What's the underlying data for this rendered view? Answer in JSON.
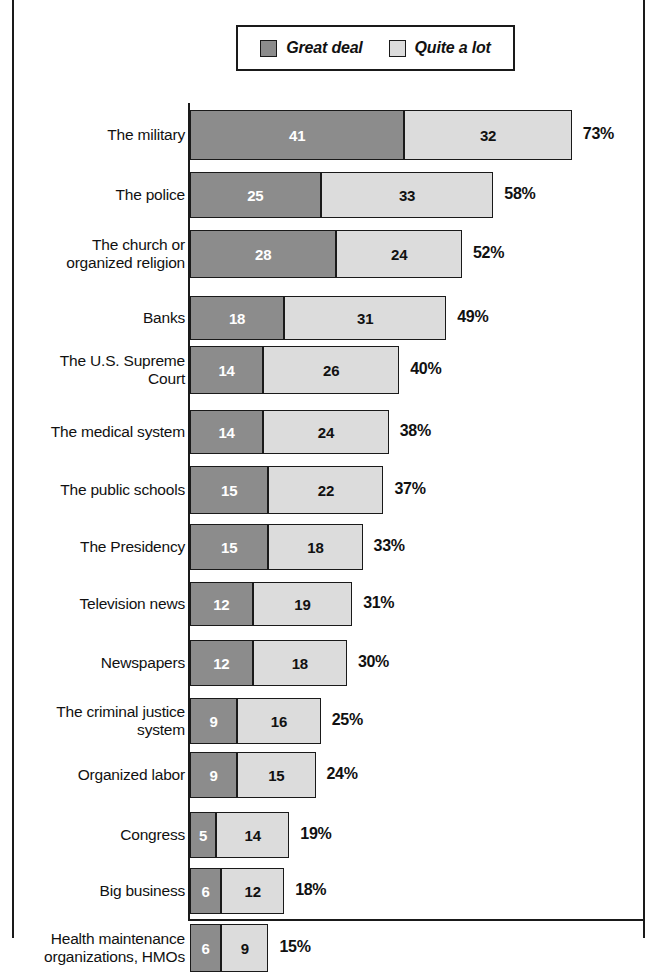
{
  "legend": {
    "items": [
      {
        "label": "Great deal",
        "color": "#8c8c8c",
        "icon": "square-swatch"
      },
      {
        "label": "Quite a lot",
        "color": "#dcdcdc",
        "icon": "square-swatch"
      }
    ]
  },
  "chart_data": {
    "type": "bar",
    "orientation": "horizontal",
    "stacked": true,
    "title": "",
    "subtitle": "",
    "xlabel": "",
    "ylabel": "",
    "grid": false,
    "legend_position": "top-center",
    "value_suffix": "%",
    "xlim": [
      0,
      73
    ],
    "categories": [
      "The military",
      "The police",
      "The church or organized religion",
      "Banks",
      "The U.S. Supreme Court",
      "The medical system",
      "The public schools",
      "The Presidency",
      "Television news",
      "Newspapers",
      "The criminal justice system",
      "Organized labor",
      "Congress",
      "Big business",
      "Health maintenance organizations, HMOs"
    ],
    "category_lines": [
      [
        "The military"
      ],
      [
        "The police"
      ],
      [
        "The church or",
        "organized religion"
      ],
      [
        "Banks"
      ],
      [
        "The U.S. Supreme",
        "Court"
      ],
      [
        "The medical system"
      ],
      [
        "The public schools"
      ],
      [
        "The Presidency"
      ],
      [
        "Television news"
      ],
      [
        "Newspapers"
      ],
      [
        "The criminal justice",
        "system"
      ],
      [
        "Organized labor"
      ],
      [
        "Congress"
      ],
      [
        "Big business"
      ],
      [
        "Health maintenance",
        "organizations, HMOs"
      ]
    ],
    "series": [
      {
        "name": "Great deal",
        "color": "#8c8c8c",
        "values": [
          41,
          25,
          28,
          18,
          14,
          14,
          15,
          15,
          12,
          12,
          9,
          9,
          5,
          6,
          6
        ]
      },
      {
        "name": "Quite a lot",
        "color": "#dcdcdc",
        "values": [
          32,
          33,
          24,
          31,
          26,
          24,
          22,
          18,
          19,
          18,
          16,
          15,
          14,
          12,
          9
        ]
      }
    ],
    "totals": [
      73,
      58,
      52,
      49,
      40,
      38,
      37,
      33,
      31,
      30,
      25,
      24,
      19,
      18,
      15
    ],
    "total_labels": [
      "73%",
      "58%",
      "52%",
      "49%",
      "40%",
      "38%",
      "37%",
      "33%",
      "31%",
      "30%",
      "25%",
      "24%",
      "19%",
      "18%",
      "15%"
    ]
  },
  "layout": {
    "px_per_unit": 5.23,
    "bar_left": 190,
    "row_tops": [
      10,
      72,
      130,
      196,
      246,
      310,
      366,
      424,
      482,
      540,
      598,
      652,
      712,
      768,
      824
    ],
    "row_heights": [
      50,
      46,
      48,
      44,
      48,
      44,
      48,
      46,
      44,
      46,
      46,
      46,
      46,
      46,
      48
    ]
  }
}
